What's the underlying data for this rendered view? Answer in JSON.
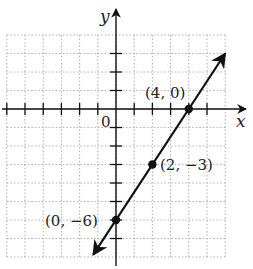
{
  "chart_data": {
    "type": "line",
    "title": "",
    "xlabel": "x",
    "ylabel": "y",
    "xlim": [
      -6,
      6
    ],
    "ylim": [
      -8,
      4
    ],
    "grid": true,
    "origin_label": "0",
    "line": {
      "slope": 1.5,
      "intercept": -6,
      "equation": "y = (3/2)x - 6",
      "arrows_both_ends": true
    },
    "points": [
      {
        "x": 4,
        "y": 0,
        "label": "(4, 0)"
      },
      {
        "x": 2,
        "y": -3,
        "label": "(2, −3)"
      },
      {
        "x": 0,
        "y": -6,
        "label": "(0, −6)"
      }
    ],
    "colors": {
      "line": "#111111",
      "grid": "#b0b0b0",
      "axes": "#111111"
    }
  }
}
